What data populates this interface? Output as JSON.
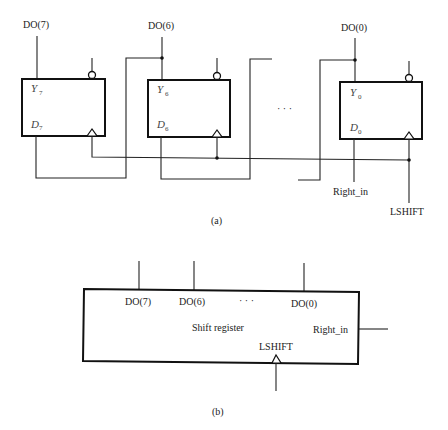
{
  "figure_a": {
    "caption": "(a)",
    "outputs": [
      "DO(7)",
      "DO(6)",
      "DO(0)"
    ],
    "flipflops": [
      {
        "y_label": "Y",
        "y_sub": "7",
        "d_label": "D",
        "d_sub": "7"
      },
      {
        "y_label": "Y",
        "y_sub": "6",
        "d_label": "D",
        "d_sub": "6"
      },
      {
        "y_label": "Y",
        "y_sub": "0",
        "d_label": "D",
        "d_sub": "0"
      }
    ],
    "ellipsis": "· · ·",
    "right_in": "Right_in",
    "clock": "LSHIFT"
  },
  "figure_b": {
    "caption": "(b)",
    "outputs": [
      "DO(7)",
      "DO(6)",
      "DO(0)"
    ],
    "ellipsis": "· · ·",
    "title": "Shift register",
    "right_in": "Right_in",
    "clock": "LSHIFT"
  }
}
